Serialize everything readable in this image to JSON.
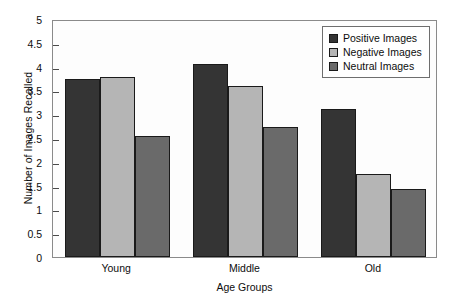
{
  "chart_data": {
    "type": "bar",
    "title": "",
    "xlabel": "Age Groups",
    "ylabel": "Number of Images Recalled",
    "categories": [
      "Young",
      "Middle",
      "Old"
    ],
    "series": [
      {
        "name": "Positive Images",
        "color": "#343434",
        "values": [
          3.75,
          4.05,
          3.1
        ]
      },
      {
        "name": "Negative Images",
        "color": "#b5b5b5",
        "values": [
          3.78,
          3.6,
          1.75
        ]
      },
      {
        "name": "Neutral Images",
        "color": "#6a6a6a",
        "values": [
          2.55,
          2.73,
          1.42
        ]
      }
    ],
    "ylim": [
      0,
      5
    ],
    "ytick_labels": [
      "5",
      "4.5",
      "4",
      "3.5",
      "3",
      "2.5",
      "2",
      "1.5",
      "1",
      "0.5",
      "0"
    ],
    "ytick_values": [
      5,
      4.5,
      4,
      3.5,
      3,
      2.5,
      2,
      1.5,
      1,
      0.5,
      0
    ],
    "grid": false,
    "legend_position": "top-right"
  }
}
